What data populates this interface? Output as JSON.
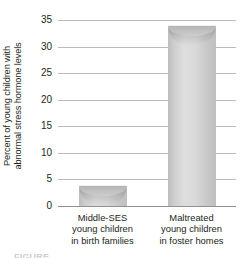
{
  "chart_data": {
    "type": "bar",
    "title": "",
    "subtitle": "",
    "xlabel": "",
    "ylabel": "Percent of young children with abnormal stress hormone levels",
    "categories": [
      "Middle-SES young children in birth families",
      "Maltreated young children in foster homes"
    ],
    "category_lines": [
      [
        "Middle-SES",
        "young children",
        "in birth families"
      ],
      [
        "Maltreated",
        "young children",
        "in foster homes"
      ]
    ],
    "values": [
      4,
      34
    ],
    "ylim": [
      0,
      35
    ],
    "ytick_values": [
      0,
      5,
      10,
      15,
      20,
      25,
      30,
      35
    ],
    "ytick_labels": [
      "0",
      "5",
      "10",
      "15",
      "20",
      "25",
      "30",
      "35"
    ],
    "grid": true,
    "legend": false,
    "legend_position": "none",
    "bar_style": "cylinder",
    "bar_color": "#d2d2d2",
    "grid_color": "#b8bcbe",
    "axis_color": "#8d9194",
    "text_color": "#231f20"
  },
  "ylabel_lines": [
    "Percent of young children with",
    "abnormal stress hormone levels"
  ],
  "caption": {
    "fragment": "FIGURE"
  }
}
